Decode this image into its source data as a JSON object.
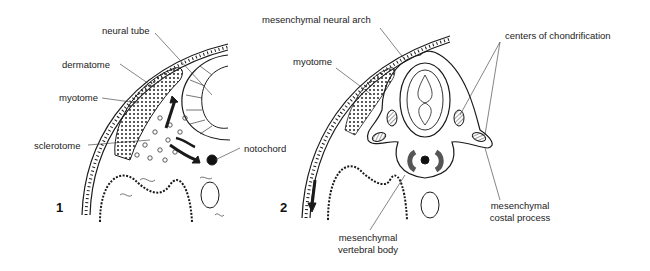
{
  "figure": {
    "panels": [
      {
        "number": "1",
        "labels": {
          "neural_tube": "neural tube",
          "dermatome": "dermatome",
          "myotome": "myotome",
          "sclerotome": "sclerotome",
          "notochord": "notochord"
        }
      },
      {
        "number": "2",
        "labels": {
          "mesenchymal_neural_arch": "mesenchymal neural arch",
          "myotome": "myotome",
          "centers_of_chondrification": "centers of chondrification",
          "costal_process_line1": "mesenchymal",
          "costal_process_line2": "costal process",
          "vertebral_body_line1": "mesenchymal",
          "vertebral_body_line2": "vertebral body"
        }
      }
    ],
    "colors": {
      "ink": "#1a1a1a",
      "background": "#ffffff",
      "hatch": "#888888"
    }
  }
}
